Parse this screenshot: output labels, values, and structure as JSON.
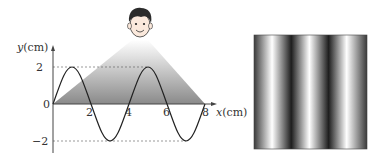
{
  "graph": {
    "y_axis_label_var": "y",
    "y_axis_label_unit": "(cm)",
    "x_axis_label_var": "x",
    "x_axis_label_unit": "(cm)",
    "y_ticks": [
      "2",
      "0",
      "−2"
    ],
    "x_ticks": [
      "2",
      "4",
      "6",
      "8"
    ],
    "wave": {
      "amplitude_cm": 2,
      "wavelength_cm": 4,
      "x_range_cm": [
        0,
        8
      ]
    }
  },
  "observer": {
    "icon": "boy-face-icon"
  },
  "fringe_pattern": {
    "bright_stripes": 3,
    "description": "vertical bright and dark interference stripes"
  }
}
